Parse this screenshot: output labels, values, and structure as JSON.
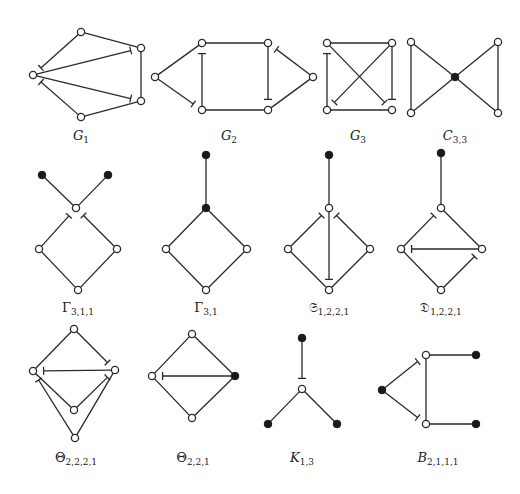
{
  "figure": {
    "graphs": [
      {
        "id": "G1",
        "label": "G",
        "label_sub": "1",
        "italic": true,
        "label_pos": [
          81,
          140
        ],
        "nodes": [
          {
            "x": 33,
            "y": 75,
            "filled": false
          },
          {
            "x": 81,
            "y": 32,
            "filled": false
          },
          {
            "x": 141,
            "y": 48,
            "filled": false
          },
          {
            "x": 141,
            "y": 101,
            "filled": false
          },
          {
            "x": 81,
            "y": 117,
            "filled": false
          }
        ],
        "edges": [
          {
            "from": 1,
            "to": 2
          },
          {
            "from": 2,
            "to": 3
          },
          {
            "from": 3,
            "to": 4
          },
          {
            "from": 1,
            "to": 0,
            "tick": "end"
          },
          {
            "from": 4,
            "to": 0,
            "tick": "end"
          },
          {
            "from": 0,
            "to": 2,
            "tick": "end"
          },
          {
            "from": 0,
            "to": 3,
            "tick": "end"
          }
        ]
      },
      {
        "id": "G2",
        "label": "G",
        "label_sub": "2",
        "italic": true,
        "label_pos": [
          229,
          140
        ],
        "nodes": [
          {
            "x": 155,
            "y": 77,
            "filled": false
          },
          {
            "x": 202,
            "y": 43,
            "filled": false
          },
          {
            "x": 268,
            "y": 43,
            "filled": false
          },
          {
            "x": 202,
            "y": 110,
            "filled": false
          },
          {
            "x": 268,
            "y": 110,
            "filled": false
          },
          {
            "x": 313,
            "y": 77,
            "filled": false
          }
        ],
        "edges": [
          {
            "from": 0,
            "to": 1
          },
          {
            "from": 1,
            "to": 2
          },
          {
            "from": 3,
            "to": 4
          },
          {
            "from": 0,
            "to": 3,
            "tick": "end"
          },
          {
            "from": 3,
            "to": 1,
            "tick": "end"
          },
          {
            "from": 2,
            "to": 4,
            "tick": "end"
          },
          {
            "from": 5,
            "to": 2,
            "tick": "end"
          },
          {
            "from": 5,
            "to": 4
          }
        ]
      },
      {
        "id": "G3",
        "label": "G",
        "label_sub": "3",
        "italic": true,
        "label_pos": [
          358,
          140
        ],
        "nodes": [
          {
            "x": 327,
            "y": 43,
            "filled": false
          },
          {
            "x": 392,
            "y": 43,
            "filled": false
          },
          {
            "x": 327,
            "y": 110,
            "filled": false
          },
          {
            "x": 392,
            "y": 110,
            "filled": false
          }
        ],
        "edges": [
          {
            "from": 0,
            "to": 1
          },
          {
            "from": 2,
            "to": 3
          },
          {
            "from": 2,
            "to": 0,
            "tick": "end"
          },
          {
            "from": 1,
            "to": 3,
            "tick": "end"
          },
          {
            "from": 0,
            "to": 3,
            "tick": "end"
          },
          {
            "from": 1,
            "to": 2,
            "tick": "end"
          }
        ]
      },
      {
        "id": "C33",
        "label": "C",
        "label_sub": "3,3",
        "italic": true,
        "label_pos": [
          455,
          140
        ],
        "nodes": [
          {
            "x": 411,
            "y": 42,
            "filled": false
          },
          {
            "x": 411,
            "y": 113,
            "filled": false
          },
          {
            "x": 455,
            "y": 77,
            "filled": true
          },
          {
            "x": 498,
            "y": 42,
            "filled": false
          },
          {
            "x": 498,
            "y": 113,
            "filled": false
          }
        ],
        "edges": [
          {
            "from": 0,
            "to": 1
          },
          {
            "from": 0,
            "to": 2
          },
          {
            "from": 1,
            "to": 2
          },
          {
            "from": 2,
            "to": 3
          },
          {
            "from": 2,
            "to": 4
          },
          {
            "from": 3,
            "to": 4
          }
        ]
      },
      {
        "id": "Gamma311",
        "label": "Γ",
        "label_sub": "3,1,1",
        "italic": false,
        "label_pos": [
          78,
          312
        ],
        "nodes": [
          {
            "x": 42,
            "y": 175,
            "filled": true
          },
          {
            "x": 108,
            "y": 175,
            "filled": true
          },
          {
            "x": 76,
            "y": 208,
            "filled": false
          },
          {
            "x": 39,
            "y": 249,
            "filled": false
          },
          {
            "x": 117,
            "y": 249,
            "filled": false
          },
          {
            "x": 78,
            "y": 290,
            "filled": false
          }
        ],
        "edges": [
          {
            "from": 0,
            "to": 2
          },
          {
            "from": 1,
            "to": 2
          },
          {
            "from": 3,
            "to": 2,
            "tick": "end"
          },
          {
            "from": 4,
            "to": 2,
            "tick": "end"
          },
          {
            "from": 3,
            "to": 5
          },
          {
            "from": 4,
            "to": 5
          }
        ]
      },
      {
        "id": "Gamma31",
        "label": "Γ",
        "label_sub": "3,1",
        "italic": false,
        "label_pos": [
          206,
          312
        ],
        "nodes": [
          {
            "x": 206,
            "y": 155,
            "filled": true
          },
          {
            "x": 206,
            "y": 208,
            "filled": true
          },
          {
            "x": 166,
            "y": 249,
            "filled": false
          },
          {
            "x": 247,
            "y": 249,
            "filled": false
          },
          {
            "x": 206,
            "y": 290,
            "filled": false
          }
        ],
        "edges": [
          {
            "from": 0,
            "to": 1
          },
          {
            "from": 1,
            "to": 2
          },
          {
            "from": 1,
            "to": 3
          },
          {
            "from": 2,
            "to": 4
          },
          {
            "from": 3,
            "to": 4
          }
        ]
      },
      {
        "id": "S1221",
        "label": "𝔖",
        "label_sub": "1,2,2,1",
        "italic": false,
        "label_pos": [
          329,
          312
        ],
        "nodes": [
          {
            "x": 329,
            "y": 155,
            "filled": true
          },
          {
            "x": 329,
            "y": 208,
            "filled": false
          },
          {
            "x": 288,
            "y": 249,
            "filled": false
          },
          {
            "x": 370,
            "y": 249,
            "filled": false
          },
          {
            "x": 329,
            "y": 290,
            "filled": false
          }
        ],
        "edges": [
          {
            "from": 0,
            "to": 1
          },
          {
            "from": 2,
            "to": 1,
            "tick": "end"
          },
          {
            "from": 3,
            "to": 1,
            "tick": "end"
          },
          {
            "from": 1,
            "to": 4,
            "tick": "end"
          },
          {
            "from": 2,
            "to": 4
          },
          {
            "from": 3,
            "to": 4
          }
        ]
      },
      {
        "id": "D1221",
        "label": "𝔇",
        "label_sub": "1,2,2,1",
        "italic": false,
        "label_pos": [
          441,
          312
        ],
        "nodes": [
          {
            "x": 441,
            "y": 153,
            "filled": true
          },
          {
            "x": 441,
            "y": 208,
            "filled": false
          },
          {
            "x": 401,
            "y": 249,
            "filled": false
          },
          {
            "x": 482,
            "y": 249,
            "filled": false
          },
          {
            "x": 441,
            "y": 290,
            "filled": false
          }
        ],
        "edges": [
          {
            "from": 0,
            "to": 1
          },
          {
            "from": 2,
            "to": 1,
            "tick": "end"
          },
          {
            "from": 1,
            "to": 3
          },
          {
            "from": 3,
            "to": 2,
            "tick": "end"
          },
          {
            "from": 2,
            "to": 4
          },
          {
            "from": 4,
            "to": 3,
            "tick": "end"
          }
        ]
      },
      {
        "id": "Theta2221",
        "label": "Θ",
        "label_sub": "2,2,2,1",
        "italic": false,
        "label_pos": [
          76,
          462
        ],
        "nodes": [
          {
            "x": 74,
            "y": 329,
            "filled": false
          },
          {
            "x": 33,
            "y": 371,
            "filled": false
          },
          {
            "x": 115,
            "y": 370,
            "filled": false
          },
          {
            "x": 74,
            "y": 410,
            "filled": false
          },
          {
            "x": 75,
            "y": 438,
            "filled": false
          }
        ],
        "edges": [
          {
            "from": 0,
            "to": 1
          },
          {
            "from": 0,
            "to": 2,
            "tick": "end"
          },
          {
            "from": 2,
            "to": 1,
            "tick": "end"
          },
          {
            "from": 1,
            "to": 3
          },
          {
            "from": 3,
            "to": 2,
            "tick": "end"
          },
          {
            "from": 4,
            "to": 1,
            "tick": "end"
          },
          {
            "from": 4,
            "to": 2
          }
        ]
      },
      {
        "id": "Theta221",
        "label": "Θ",
        "label_sub": "2,2,1",
        "italic": false,
        "label_pos": [
          193,
          462
        ],
        "nodes": [
          {
            "x": 192,
            "y": 334,
            "filled": false
          },
          {
            "x": 152,
            "y": 376,
            "filled": false
          },
          {
            "x": 235,
            "y": 376,
            "filled": true
          },
          {
            "x": 192,
            "y": 418,
            "filled": false
          }
        ],
        "edges": [
          {
            "from": 0,
            "to": 1
          },
          {
            "from": 0,
            "to": 2
          },
          {
            "from": 2,
            "to": 1,
            "tick": "end"
          },
          {
            "from": 1,
            "to": 3
          },
          {
            "from": 2,
            "to": 3
          }
        ]
      },
      {
        "id": "K13",
        "label": "K",
        "label_sub": "1,3",
        "italic": true,
        "label_pos": [
          302,
          462
        ],
        "nodes": [
          {
            "x": 302,
            "y": 338,
            "filled": true
          },
          {
            "x": 302,
            "y": 389,
            "filled": false
          },
          {
            "x": 268,
            "y": 424,
            "filled": true
          },
          {
            "x": 337,
            "y": 424,
            "filled": true
          }
        ],
        "edges": [
          {
            "from": 0,
            "to": 1,
            "tick": "end"
          },
          {
            "from": 1,
            "to": 2
          },
          {
            "from": 1,
            "to": 3
          }
        ]
      },
      {
        "id": "B2111",
        "label": "B",
        "label_sub": "2,1,1,1",
        "italic": true,
        "label_pos": [
          438,
          462
        ],
        "nodes": [
          {
            "x": 382,
            "y": 390,
            "filled": true
          },
          {
            "x": 426,
            "y": 355,
            "filled": false
          },
          {
            "x": 426,
            "y": 424,
            "filled": false
          },
          {
            "x": 476,
            "y": 355,
            "filled": true
          },
          {
            "x": 476,
            "y": 424,
            "filled": true
          }
        ],
        "edges": [
          {
            "from": 0,
            "to": 1,
            "tick": "end"
          },
          {
            "from": 0,
            "to": 2,
            "tick": "end"
          },
          {
            "from": 1,
            "to": 2
          },
          {
            "from": 1,
            "to": 3
          },
          {
            "from": 2,
            "to": 4
          }
        ]
      }
    ]
  }
}
